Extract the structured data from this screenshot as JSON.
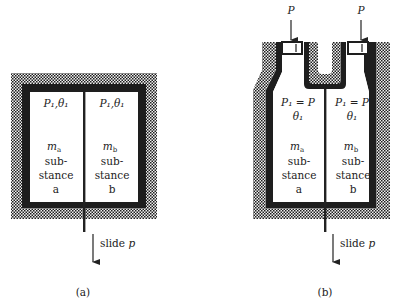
{
  "panel_a": {
    "caption": "(a)",
    "left_state": "P₁,θ₁",
    "right_state": "P₁,θ₁",
    "left_mass": "m",
    "left_mass_sub": "a",
    "right_mass": "m",
    "right_mass_sub": "b",
    "left_substance": [
      "sub-",
      "stance",
      "a"
    ],
    "right_substance": [
      "sub-",
      "stance",
      "b"
    ],
    "slide_label": "slide",
    "slide_var": "p"
  },
  "panel_b": {
    "caption": "(b)",
    "pressure_left": "P",
    "pressure_right": "P",
    "left_state_1": "P₁ = P",
    "left_state_2": "θ₁",
    "right_state_1": "P₁ = P",
    "right_state_2": "θ₁",
    "left_mass": "m",
    "left_mass_sub": "a",
    "right_mass": "m",
    "right_mass_sub": "b",
    "left_substance": [
      "sub-",
      "stance",
      "a"
    ],
    "right_substance": [
      "sub-",
      "stance",
      "b"
    ],
    "slide_label": "slide",
    "slide_var": "p"
  },
  "colors": {
    "insulation_dark": "#1a1a1a",
    "insulation_light": "#f2f2f2",
    "wall": "#1e1e1e"
  }
}
